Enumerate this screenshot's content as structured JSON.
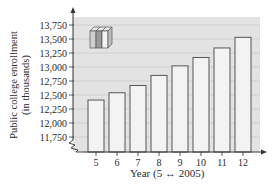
{
  "chart_data": {
    "type": "bar",
    "title": "",
    "xlabel": "Year (5 ↔ 2005)",
    "ylabel": "Public college enrollment (in thousands)",
    "ylabel_lines": [
      "Public college enrollment",
      "(in thousands)"
    ],
    "categories": [
      "5",
      "6",
      "7",
      "8",
      "9",
      "10",
      "11",
      "12"
    ],
    "values": [
      12410,
      12540,
      12670,
      12850,
      13020,
      13170,
      13340,
      13530
    ],
    "yticks": [
      11750,
      12000,
      12250,
      12500,
      12750,
      13000,
      13250,
      13500,
      13750
    ],
    "ytick_labels": [
      "11,750",
      "12,000",
      "12,250",
      "12,500",
      "12,750",
      "13,000",
      "13,250",
      "13,500",
      "13,750"
    ],
    "ylim": [
      11625,
      13875
    ],
    "grid": true,
    "axis_break": true,
    "legend": null,
    "decoration": "books-icon"
  },
  "colors": {
    "plot_bg": "#e3e3e3",
    "bar_fill": "#f3f3f3",
    "bar_stroke": "#555555",
    "grid": "#cfcfcf",
    "axis": "#333333",
    "text": "#2a2a2a"
  }
}
